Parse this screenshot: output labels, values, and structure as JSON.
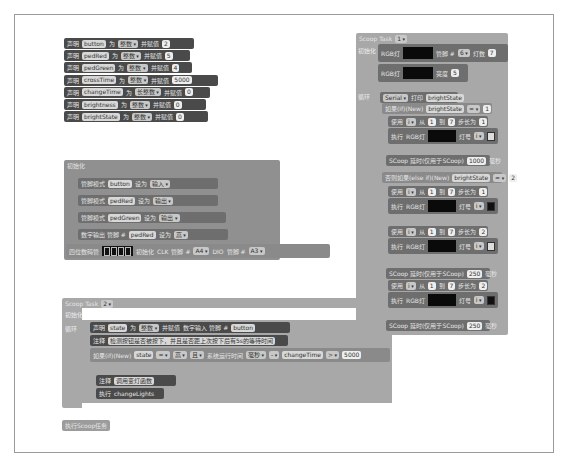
{
  "declarations": [
    {
      "kw": "声明",
      "var": "button",
      "as": "为",
      "type": "整数",
      "assign": "并赋值",
      "value": "2"
    },
    {
      "kw": "声明",
      "var": "pedRed",
      "as": "为",
      "type": "整数",
      "assign": "并赋值",
      "value": "5"
    },
    {
      "kw": "声明",
      "var": "pedGreen",
      "as": "为",
      "type": "整数",
      "assign": "并赋值",
      "value": "4"
    },
    {
      "kw": "声明",
      "var": "crossTime",
      "as": "为",
      "type": "整数",
      "assign": "并赋值",
      "value": "5000"
    },
    {
      "kw": "声明",
      "var": "changeTime",
      "as": "为",
      "type": "长整数",
      "assign": "并赋值",
      "value": "0"
    },
    {
      "kw": "声明",
      "var": "brightness",
      "as": "为",
      "type": "整数",
      "assign": "并赋值",
      "value": "0"
    },
    {
      "kw": "声明",
      "var": "brightState",
      "as": "为",
      "type": "整数",
      "assign": "并赋值",
      "value": "0"
    }
  ],
  "init": {
    "title": "初始化",
    "pin_modes": [
      {
        "label": "管脚模式",
        "pin": "button",
        "set": "设为",
        "mode": "输入"
      },
      {
        "label": "管脚模式",
        "pin": "pedRed",
        "set": "设为",
        "mode": "输出"
      },
      {
        "label": "管脚模式",
        "pin": "pedGreen",
        "set": "设为",
        "mode": "输出"
      }
    ],
    "digital_write": {
      "label": "数字输出 管脚 #",
      "pin": "pedRed",
      "set": "设为",
      "value": "高"
    },
    "display": {
      "label": "四位数码管",
      "init": "初始化",
      "clk": "CLK",
      "clk_pin_label": "管脚 #",
      "clk_pin": "A4",
      "dio": "DIO",
      "dio_pin_label": "管脚 #",
      "dio_pin": "A3"
    }
  },
  "task2": {
    "header": "Scoop Task",
    "id": "2",
    "setup_label": "初始化",
    "loop_label": "循环",
    "declare": {
      "kw": "声明",
      "var": "state",
      "as": "为",
      "type": "整数",
      "assign": "并赋值",
      "read": "数字输入 管脚 #",
      "pin": "button"
    },
    "comment1": {
      "label": "注释",
      "text": "检测按钮是否被按下，并且是否距上次按下后有5s的等待时间"
    },
    "if": {
      "label": "如果(if)(New)",
      "var": "state",
      "op": "=",
      "val": "高",
      "and": "且",
      "millis": "系统运行时间",
      "unit": "毫秒",
      "minus": "-",
      "changeTime": "changeTime",
      "gt": ">",
      "limit": "5000"
    },
    "comment2": {
      "label": "注释",
      "text": "调用变灯函数"
    },
    "exec": {
      "label": "执行",
      "fn": "changeLights"
    }
  },
  "run_scoop": "执行Scoop任务",
  "task1": {
    "header": "Scoop Task",
    "id": "1",
    "setup_label": "初始化",
    "rgb_init": {
      "label": "RGB灯",
      "pin_label": "管脚 #",
      "pin": "6",
      "count_label": "灯数",
      "count": "7"
    },
    "rgb_bright": {
      "label": "RGB灯",
      "bright_label": "亮度",
      "value": "5"
    },
    "loop_label": "循环",
    "serial": {
      "label": "Serial",
      "print": "打印",
      "var": "brightState"
    },
    "if1": {
      "label": "如果(if)(New)",
      "var": "brightState",
      "op": "=",
      "val": "1"
    },
    "for1": {
      "label": "使用",
      "var": "i",
      "from": "从",
      "start": "1",
      "to": "到",
      "end": "7",
      "step_label": "步长为",
      "step": "1"
    },
    "exec_label": "执行",
    "rgb_set_label": "RGB灯",
    "light_label": "灯号",
    "light_var": "i",
    "delay1": {
      "label": "SCoop 延时(仅用于SCoop)",
      "value": "1000",
      "unit": "毫秒"
    },
    "elseif": {
      "label": "否则如果(else if)(New)",
      "var": "brightState",
      "op": "=",
      "val": "2"
    },
    "for2": {
      "start": "1",
      "end": "7",
      "step": "1"
    },
    "for3": {
      "start": "1",
      "end": "7",
      "step": "2"
    },
    "delay2": {
      "label": "SCoop 延时(仅用于SCoop)",
      "value": "250",
      "unit": "毫秒"
    },
    "for4": {
      "start": "1",
      "end": "7",
      "step": "2"
    },
    "delay3": {
      "label": "SCoop 延时(仅用于SCoop)",
      "value": "250",
      "unit": "毫秒"
    }
  }
}
